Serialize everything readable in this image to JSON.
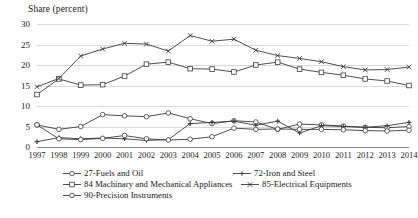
{
  "chart_data": {
    "type": "line",
    "title": "",
    "ylabel": "Share (percent)",
    "xlabel": "",
    "ylim": [
      0,
      30
    ],
    "yticks": [
      0,
      5,
      10,
      15,
      20,
      25,
      30
    ],
    "grid": true,
    "legend_position": "bottom",
    "categories": [
      "1997",
      "1998",
      "1999",
      "2000",
      "2001",
      "2002",
      "2003",
      "2004",
      "2005",
      "2006",
      "2007",
      "2008",
      "2009",
      "2010",
      "2011",
      "2012",
      "2013",
      "2014"
    ],
    "series": [
      {
        "name": "27-Fuels and Oil",
        "marker": "circle",
        "values": [
          5.4,
          4.3,
          5.0,
          7.9,
          7.6,
          7.4,
          8.3,
          6.9,
          5.7,
          6.4,
          6.1,
          4.3,
          5.6,
          5.4,
          5.1,
          4.8,
          4.7,
          5.0
        ]
      },
      {
        "name": "72-Iron and Steel",
        "marker": "cross",
        "values": [
          1.3,
          2.3,
          2.0,
          2.2,
          2.0,
          1.6,
          1.8,
          5.7,
          6.0,
          6.3,
          5.3,
          6.3,
          3.4,
          5.2,
          5.0,
          4.8,
          5.2,
          6.0
        ]
      },
      {
        "name": "84 Machinary and Mechanical Appliances",
        "marker": "square",
        "values": [
          12.8,
          16.6,
          15.1,
          15.2,
          17.3,
          20.2,
          20.7,
          19.1,
          19.0,
          18.3,
          20.0,
          20.7,
          19.0,
          18.2,
          17.5,
          16.6,
          16.1,
          15.0
        ]
      },
      {
        "name": "85-Electrical Equipments",
        "marker": "x",
        "values": [
          14.7,
          16.7,
          22.2,
          23.9,
          25.3,
          25.1,
          23.4,
          27.2,
          25.8,
          26.3,
          23.6,
          22.3,
          21.6,
          20.8,
          19.6,
          18.8,
          18.9,
          19.5
        ]
      },
      {
        "name": "90-Precision Instruments",
        "marker": "circle-open",
        "values": [
          5.4,
          2.0,
          1.8,
          2.1,
          2.8,
          2.0,
          1.7,
          1.9,
          2.5,
          4.6,
          4.3,
          4.4,
          4.3,
          4.3,
          4.2,
          4.0,
          3.9,
          4.1
        ]
      }
    ]
  },
  "legend": {
    "items": [
      {
        "label": "27-Fuels and Oil",
        "marker": "circle-open-marker"
      },
      {
        "label": "72-Iron and Steel",
        "marker": "cross-marker"
      },
      {
        "label": "84 Machinary and Mechanical Appliances",
        "marker": "square-open-marker"
      },
      {
        "label": "85-Electrical Equipments",
        "marker": "x-marker"
      },
      {
        "label": "90-Precision Instruments",
        "marker": "circle-open-marker"
      }
    ]
  }
}
